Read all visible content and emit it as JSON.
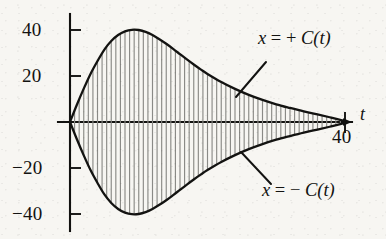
{
  "chart_data": {
    "type": "line",
    "title": "",
    "subtitle": "",
    "xlabel": "t",
    "ylabel": "",
    "xlim": [
      0,
      40
    ],
    "ylim": [
      -45,
      45
    ],
    "grid": false,
    "legend_position": "inline-annotations",
    "x_ticks": [
      {
        "value": 40,
        "label": "40"
      }
    ],
    "y_ticks": [
      {
        "value": 40,
        "label": "40"
      },
      {
        "value": 20,
        "label": "20"
      },
      {
        "value": -20,
        "label": "-20"
      },
      {
        "value": -40,
        "label": "-40"
      }
    ],
    "oscillation": {
      "cycles": 30,
      "carrier_color": "#8a8a86",
      "note": "dense vertical oscillation strokes filling the envelope"
    },
    "series": [
      {
        "name": "x = + C(t)",
        "role": "upper-envelope",
        "color": "#131311",
        "x": [
          0,
          1,
          2,
          3,
          4,
          5,
          6,
          7,
          8,
          9,
          10,
          11,
          12,
          13,
          14,
          15,
          16,
          17,
          18,
          19,
          20,
          22,
          24,
          26,
          28,
          30,
          32,
          34,
          36,
          38,
          40
        ],
        "values": [
          0,
          7.5,
          14.5,
          21,
          26.5,
          31.5,
          35.2,
          37.8,
          39.4,
          40.1,
          40,
          39.2,
          37.8,
          36,
          34,
          31.8,
          29.5,
          27.2,
          25,
          22.9,
          20.9,
          17.4,
          14.4,
          11.8,
          9.6,
          7.7,
          6.1,
          4.6,
          3.3,
          1.9,
          0.4
        ]
      },
      {
        "name": "x = - C(t)",
        "role": "lower-envelope",
        "color": "#131311",
        "x": [
          0,
          1,
          2,
          3,
          4,
          5,
          6,
          7,
          8,
          9,
          10,
          11,
          12,
          13,
          14,
          15,
          16,
          17,
          18,
          19,
          20,
          22,
          24,
          26,
          28,
          30,
          32,
          34,
          36,
          38,
          40
        ],
        "values": [
          0,
          -7.5,
          -14.5,
          -21,
          -26.5,
          -31.5,
          -35.2,
          -37.8,
          -39.4,
          -40.1,
          -40,
          -39.2,
          -37.8,
          -36,
          -34,
          -31.8,
          -29.5,
          -27.2,
          -25,
          -22.9,
          -20.9,
          -17.4,
          -14.4,
          -11.8,
          -9.6,
          -7.7,
          -6.1,
          -4.6,
          -3.3,
          -1.9,
          -0.4
        ]
      }
    ],
    "annotations": [
      {
        "id": "upper",
        "text_plain": "x = + C(t)",
        "var": "x",
        "eq": "=",
        "sign": "+",
        "func": "C",
        "arg": "(t)"
      },
      {
        "id": "lower",
        "text_plain": "x = - C(t)",
        "var": "x",
        "eq": "=",
        "sign": "−",
        "func": "C",
        "arg": "(t)"
      }
    ]
  },
  "axis": {
    "t_label": "t",
    "t_end_label": "40"
  },
  "y_labels": {
    "plus40": "40",
    "plus20": "20",
    "minus20": "−20",
    "minus40": "−40"
  },
  "annotations": {
    "upper": {
      "var": "x",
      "eq": "=",
      "sign": "+",
      "func": "C",
      "arg": "(t)"
    },
    "lower": {
      "var": "x",
      "eq": "=",
      "sign": "−",
      "func": "C",
      "arg": "(t)"
    }
  }
}
